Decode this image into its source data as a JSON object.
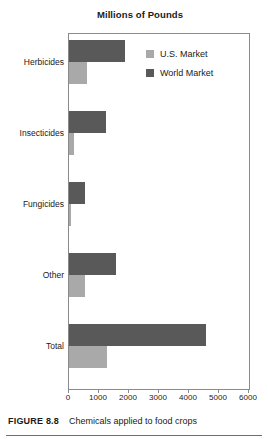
{
  "chart_data": {
    "type": "bar",
    "orientation": "horizontal",
    "title": "Millions of Pounds",
    "xlabel": "",
    "ylabel": "",
    "xlim": [
      0,
      6000
    ],
    "xticks": [
      0,
      1000,
      2000,
      3000,
      4000,
      5000,
      6000
    ],
    "xtick_labels": [
      "0",
      "1000",
      "2000",
      "3000",
      "4000",
      "5000",
      "6000"
    ],
    "grid": false,
    "legend_position": "top-right",
    "categories": [
      "Herbicides",
      "Insecticides",
      "Fungicides",
      "Other",
      "Total"
    ],
    "series": [
      {
        "name": "U.S. Market",
        "color": "#a9a9a9",
        "values": [
          600,
          170,
          70,
          530,
          1270
        ]
      },
      {
        "name": "World Market",
        "color": "#595959",
        "values": [
          1870,
          1230,
          530,
          1570,
          4570
        ]
      }
    ]
  },
  "legend": {
    "entries": [
      {
        "label": "U.S. Market",
        "swatch": "us"
      },
      {
        "label": "World Market",
        "swatch": "world"
      }
    ]
  },
  "caption": {
    "label": "FIGURE 8.8",
    "text": "Chemicals applied to food crops"
  }
}
